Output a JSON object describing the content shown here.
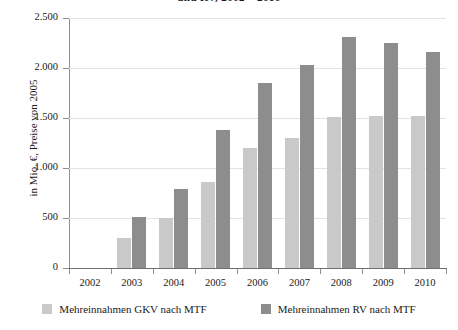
{
  "chart_data": {
    "type": "bar",
    "title": "und RV, 2002 – 2010",
    "ylabel": "in Mio. €, Preise von 2005",
    "xlabel": "",
    "ylim": [
      0,
      2500
    ],
    "yticks": [
      "0",
      "500",
      "1.000",
      "1.500",
      "2.000",
      "2.500"
    ],
    "ytick_values": [
      0,
      500,
      1000,
      1500,
      2000,
      2500
    ],
    "grid": true,
    "legend_position": "bottom",
    "categories": [
      "2002",
      "2003",
      "2004",
      "2005",
      "2006",
      "2007",
      "2008",
      "2009",
      "2010"
    ],
    "series": [
      {
        "name": "Mehreinnahmen GKV nach MTF",
        "color": "#c9c9c9",
        "values": [
          0,
          300,
          500,
          860,
          1200,
          1300,
          1510,
          1520,
          1520
        ]
      },
      {
        "name": "Mehreinnahmen RV nach MTF",
        "color": "#8d8d8d",
        "values": [
          0,
          510,
          790,
          1380,
          1850,
          2030,
          2310,
          2250,
          2160
        ]
      }
    ]
  },
  "legend": {
    "items": [
      {
        "label": "Mehreinnahmen GKV nach MTF"
      },
      {
        "label": "Mehreinnahmen RV nach MTF"
      }
    ]
  }
}
